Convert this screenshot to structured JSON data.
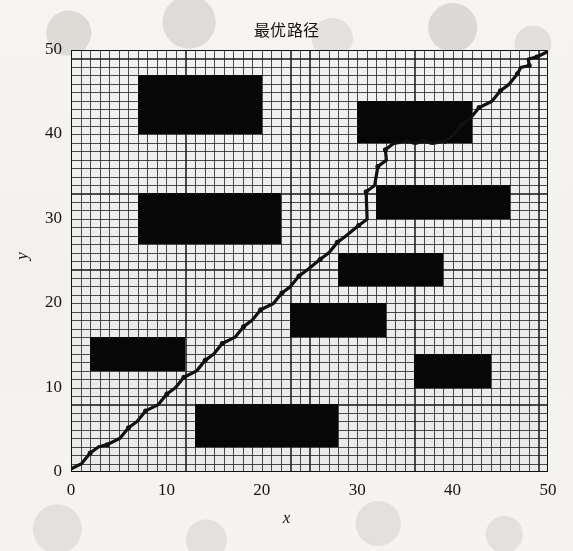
{
  "figure": {
    "title": "最优路径",
    "xlabel": "x",
    "ylabel": "y",
    "background_color": "#f4f3f0",
    "plot_background_color": "#ffffff",
    "obstacle_color": "#070707",
    "path_color": "#111111",
    "grid_color": "#1e1e1e"
  },
  "axes": {
    "xticks": [
      "0",
      "10",
      "20",
      "30",
      "40",
      "50"
    ],
    "yticks": [
      "0",
      "10",
      "20",
      "30",
      "40",
      "50"
    ]
  },
  "chart_data": {
    "type": "line",
    "title": "最优路径",
    "xlabel": "x",
    "ylabel": "y",
    "xlim": [
      0,
      50
    ],
    "ylim": [
      0,
      50
    ],
    "grid": true,
    "grid_step": 1,
    "legend": "none",
    "series": [
      {
        "name": "最优路径",
        "marker": "jagged-line-with-dots",
        "x": [
          0,
          1,
          2,
          3,
          4,
          5,
          6,
          7,
          8,
          9,
          10,
          11,
          12,
          13,
          14,
          15,
          16,
          17,
          18,
          19,
          20,
          21,
          22,
          23,
          24,
          25,
          26,
          27,
          28,
          29,
          30,
          31,
          31,
          32,
          32,
          33,
          33,
          34,
          35,
          36,
          37,
          38,
          39,
          40,
          41,
          42,
          43,
          44,
          45,
          46,
          47,
          47,
          48,
          48,
          49,
          50
        ],
        "y": [
          0,
          1,
          2,
          3,
          3,
          4,
          5,
          6,
          7,
          8,
          9,
          10,
          11,
          12,
          13,
          14,
          15,
          16,
          17,
          18,
          19,
          20,
          21,
          22,
          23,
          24,
          25,
          26,
          27,
          28,
          29,
          30,
          33,
          34,
          36,
          37,
          38,
          39,
          39,
          39,
          39,
          39,
          39,
          40,
          41,
          42,
          43,
          44,
          45,
          46,
          47,
          48,
          48,
          49,
          49,
          50
        ]
      }
    ],
    "obstacles": [
      {
        "id": "obstacle-1",
        "x0": 7,
        "y0": 40,
        "x1": 20,
        "y1": 47
      },
      {
        "id": "obstacle-2",
        "x0": 7,
        "y0": 27,
        "x1": 22,
        "y1": 33
      },
      {
        "id": "obstacle-3",
        "x0": 2,
        "y0": 12,
        "x1": 12,
        "y1": 16
      },
      {
        "id": "obstacle-4",
        "x0": 13,
        "y0": 3,
        "x1": 28,
        "y1": 8
      },
      {
        "id": "obstacle-5",
        "x0": 30,
        "y0": 39,
        "x1": 42,
        "y1": 44
      },
      {
        "id": "obstacle-6",
        "x0": 32,
        "y0": 30,
        "x1": 46,
        "y1": 34
      },
      {
        "id": "obstacle-7",
        "x0": 28,
        "y0": 22,
        "x1": 39,
        "y1": 26
      },
      {
        "id": "obstacle-8",
        "x0": 23,
        "y0": 16,
        "x1": 33,
        "y1": 20
      },
      {
        "id": "obstacle-9",
        "x0": 36,
        "y0": 10,
        "x1": 44,
        "y1": 14
      }
    ]
  }
}
